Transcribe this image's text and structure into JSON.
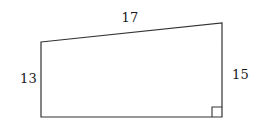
{
  "figure": {
    "kind": "right-trapezoid-quadrilateral",
    "background_color": "#ffffff",
    "stroke_color": "#333333",
    "stroke_width": 1.2,
    "fill": "none",
    "vertices": {
      "top_left": [
        41,
        42
      ],
      "top_right": [
        222,
        23
      ],
      "bottom_right": [
        222,
        117
      ],
      "bottom_left": [
        41,
        117
      ]
    },
    "right_angle_marker": {
      "present": true,
      "at_vertex": "bottom_right",
      "size": 10,
      "x": 212,
      "y": 107
    },
    "labels": {
      "top": "17",
      "left": "13",
      "right": "15"
    },
    "label_units": ""
  },
  "chart_data": {
    "type": "diagram",
    "title": "",
    "shape": "quadrilateral",
    "side_labels": [
      {
        "side": "top",
        "value": 17,
        "text": "17"
      },
      {
        "side": "left",
        "value": 13,
        "text": "13"
      },
      {
        "side": "right",
        "value": 15,
        "text": "15"
      }
    ],
    "annotations": [
      {
        "type": "right-angle",
        "location": "bottom-right-vertex"
      }
    ]
  }
}
